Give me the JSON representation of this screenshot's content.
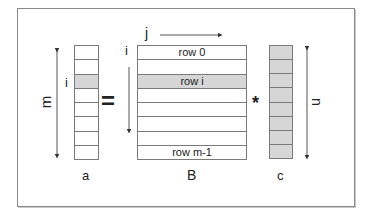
{
  "diagram": {
    "vector_a": {
      "label": "a",
      "dim_label": "m",
      "index_label": "i",
      "cells": 8,
      "shaded_index": 2
    },
    "equals": "=",
    "matrix_B": {
      "label": "B",
      "col_index_label": "j",
      "row_index_label": "i",
      "rows": [
        {
          "text": "row 0",
          "shaded": false
        },
        {
          "text": "",
          "shaded": false
        },
        {
          "text": "row i",
          "shaded": true
        },
        {
          "text": "",
          "shaded": false
        },
        {
          "text": "",
          "shaded": false
        },
        {
          "text": "",
          "shaded": false
        },
        {
          "text": "",
          "shaded": false
        },
        {
          "text": "row m-1",
          "shaded": false
        }
      ]
    },
    "times": "*",
    "vector_c": {
      "label": "c",
      "dim_label": "n",
      "cells": 8,
      "all_shaded": true
    },
    "colors": {
      "border": "#7a7a7a",
      "shade": "#d6d6d6",
      "frame": "#8a8a8a"
    }
  }
}
